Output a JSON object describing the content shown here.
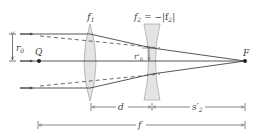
{
  "diagram": {
    "type": "optics-ray-diagram",
    "colors": {
      "ray": "#444444",
      "lens_fill": "#e2e2e2",
      "lens_stroke": "#999999",
      "axis": "#444444",
      "dimension": "#555555"
    },
    "labels": {
      "lens1": "f",
      "lens1_sub": "1",
      "lens2_prefix": "f",
      "lens2_sub": "2",
      "lens2_eq": " = −|f",
      "lens2_sub2": "2",
      "lens2_close": "|",
      "r0": "r",
      "r0_sub": "0",
      "r0_prime": "r′",
      "r0_prime_sub": "0",
      "Q": "Q",
      "F": "F",
      "d": "d",
      "s2_prime": "s′",
      "s2_prime_sub": "2",
      "f_total": "f"
    },
    "dimensions": [
      {
        "name": "d",
        "from": "lens1",
        "to": "lens2"
      },
      {
        "name": "s2_prime",
        "from": "lens2",
        "to": "F"
      },
      {
        "name": "f",
        "from": "Q",
        "to": "F"
      }
    ]
  }
}
